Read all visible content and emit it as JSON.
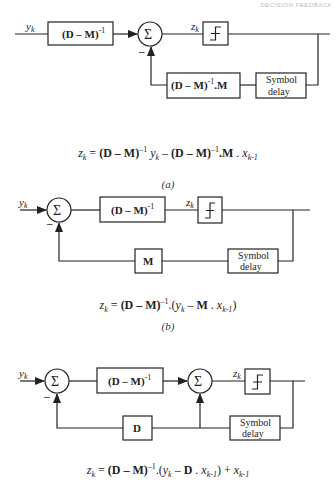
{
  "header": {
    "text": "DECISION FEEDBACK"
  },
  "diagrams": {
    "a": {
      "caption": "(a)",
      "input_label": "y_k",
      "forward_block": "(D – M)^-1",
      "sum_symbol": "Σ",
      "minus_sign": "–",
      "slicer_input_label": "z_k",
      "feedback_block": "(D – M)^-1.M",
      "delay_block_line1": "Symbol",
      "delay_block_line2": "delay",
      "equation": "z_k = (D – M)^-1 y_k – (D – M)^-1.M . x_k-1"
    },
    "b": {
      "caption": "(b)",
      "input_label": "y_k",
      "sum_symbol": "Σ",
      "minus_sign": "–",
      "forward_block": "(D – M)^-1",
      "slicer_input_label": "z_k",
      "feedback_block": "M",
      "delay_block_line1": "Symbol",
      "delay_block_line2": "delay",
      "equation": "z_k = (D – M)^-1.(y_k – M . x_k-1)"
    },
    "c": {
      "caption": "(c)",
      "input_label": "y_k",
      "sum_symbol": "Σ",
      "minus_sign": "–",
      "forward_block": "(D – M)^-1",
      "slicer_input_label": "z_k",
      "feedback_block": "D",
      "delay_block_line1": "Symbol",
      "delay_block_line2": "delay",
      "equation": "z_k = (D – M)^-1.(y_k – D . x_k-1) + x_k-1"
    }
  },
  "text": {
    "y": "y",
    "z": "z",
    "k": "k",
    "x": "x",
    "km1": "k-1",
    "eq_equals": " = ",
    "dm": "(D – M)",
    "inv": "–1",
    "Mb": "M",
    "Db": "D",
    "minus": " – ",
    "plus": " + ",
    "dot": " . ",
    "dotM": ".M",
    "open": ".(",
    "close": ")",
    "sym": "Symbol",
    "delay": "delay",
    "sigma": "Σ",
    "neg": "–",
    "blk_dm": "(D – M)",
    "sup_m1": "-1"
  },
  "colors": {
    "line": "#222222",
    "background": "#ffffff"
  }
}
